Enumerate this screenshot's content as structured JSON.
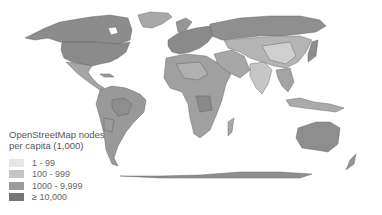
{
  "map": {
    "type": "choropleth world map",
    "projection": "equirectangular-like (Robinson)",
    "legend": {
      "title_line1": "OpenStreetMap nodes",
      "title_line2": "per capita (1,000)",
      "items": [
        {
          "label": "1 - 99",
          "color": "#e6e6e6"
        },
        {
          "label": "100 - 999",
          "color": "#c4c4c4"
        },
        {
          "label": "1000 - 9,999",
          "color": "#9a9a9a"
        },
        {
          "label": "≥ 10,000",
          "color": "#767676"
        }
      ]
    },
    "colors": {
      "background": "#ffffff",
      "border": "#555555",
      "ocean": "#ffffff"
    }
  }
}
